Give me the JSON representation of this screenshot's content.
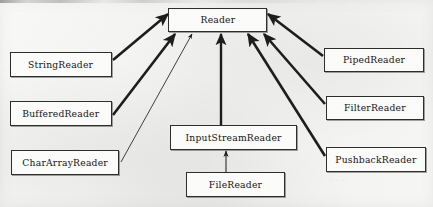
{
  "diagram": {
    "type": "uml-class-hierarchy",
    "title": "Reader",
    "root": {
      "id": "reader",
      "label": "Reader",
      "x": 168,
      "y": 8,
      "w": 99,
      "h": 24
    },
    "nodes": [
      {
        "id": "string-reader",
        "label": "StringReader",
        "x": 10,
        "y": 52,
        "w": 102,
        "h": 25
      },
      {
        "id": "buffered-reader",
        "label": "BufferedReader",
        "x": 10,
        "y": 101,
        "w": 102,
        "h": 25
      },
      {
        "id": "char-array-reader",
        "label": "CharArrayReader",
        "x": 11,
        "y": 150,
        "w": 108,
        "h": 25
      },
      {
        "id": "input-stream-reader",
        "label": "InputStreamReader",
        "x": 170,
        "y": 125,
        "w": 127,
        "h": 25
      },
      {
        "id": "file-reader",
        "label": "FileReader",
        "x": 186,
        "y": 172,
        "w": 99,
        "h": 25
      },
      {
        "id": "piped-reader",
        "label": "PipedReader",
        "x": 324,
        "y": 48,
        "w": 100,
        "h": 24
      },
      {
        "id": "filter-reader",
        "label": "FilterReader",
        "x": 326,
        "y": 96,
        "w": 98,
        "h": 24
      },
      {
        "id": "pushback-reader",
        "label": "PushbackReader",
        "x": 326,
        "y": 147,
        "w": 100,
        "h": 25
      }
    ],
    "edges": [
      {
        "id": "edge-string-reader",
        "from": "string-reader",
        "to": "reader",
        "kind": "generalization",
        "weight": "thick"
      },
      {
        "id": "edge-buffered-reader",
        "from": "buffered-reader",
        "to": "reader",
        "kind": "generalization",
        "weight": "thick"
      },
      {
        "id": "edge-char-array-reader",
        "from": "char-array-reader",
        "to": "reader",
        "kind": "generalization",
        "weight": "thin"
      },
      {
        "id": "edge-input-stream-reader",
        "from": "input-stream-reader",
        "to": "reader",
        "kind": "generalization",
        "weight": "thick"
      },
      {
        "id": "edge-piped-reader",
        "from": "piped-reader",
        "to": "reader",
        "kind": "generalization",
        "weight": "thick"
      },
      {
        "id": "edge-filter-reader",
        "from": "filter-reader",
        "to": "reader",
        "kind": "generalization",
        "weight": "thick"
      },
      {
        "id": "edge-pushback-reader",
        "from": "pushback-reader",
        "to": "reader",
        "kind": "generalization",
        "weight": "thick"
      },
      {
        "id": "edge-file-reader",
        "from": "file-reader",
        "to": "input-stream-reader",
        "kind": "generalization",
        "weight": "thin"
      }
    ],
    "colors": {
      "paper": "#f3f3f1",
      "box_fill": "#fbfbfa",
      "stroke": "#2e2e2e",
      "text": "#151515"
    }
  }
}
